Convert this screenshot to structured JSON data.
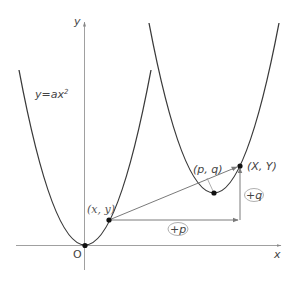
{
  "diagram": {
    "axes": {
      "x_label": "x",
      "y_label": "y",
      "origin_label": "O"
    },
    "curve_label": {
      "prefix": "y=",
      "a": "a",
      "x": "x",
      "exp": "2"
    },
    "points": {
      "original": "(x,  y)",
      "image": "(X,  Y)",
      "vertex": "(p, q)"
    },
    "translation_labels": {
      "horizontal": "+p",
      "vertical": "+q"
    },
    "colors": {
      "curve": "#3a3a3a",
      "axis": "#9a9a9a",
      "arrow": "#7a7a7a",
      "point": "#111111",
      "text": "#444444"
    }
  }
}
